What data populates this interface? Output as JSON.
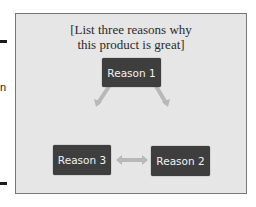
{
  "edge": {
    "fragment_text": "n"
  },
  "slide": {
    "title_line1": "[List three reasons why",
    "title_line2": "this product is great]",
    "nodes": [
      {
        "id": "reason-1",
        "label": "Reason 1"
      },
      {
        "id": "reason-2",
        "label": "Reason 2"
      },
      {
        "id": "reason-3",
        "label": "Reason 3"
      }
    ],
    "connectors": [
      {
        "from": "reason-3",
        "to": "reason-1",
        "type": "double-arrow"
      },
      {
        "from": "reason-1",
        "to": "reason-2",
        "type": "double-arrow"
      },
      {
        "from": "reason-3",
        "to": "reason-2",
        "type": "double-arrow"
      }
    ],
    "colors": {
      "panel": "#e6e6e6",
      "node": "#3e3e3e",
      "node_text": "#f2f2f2",
      "arrow": "#b8b8b8"
    }
  }
}
